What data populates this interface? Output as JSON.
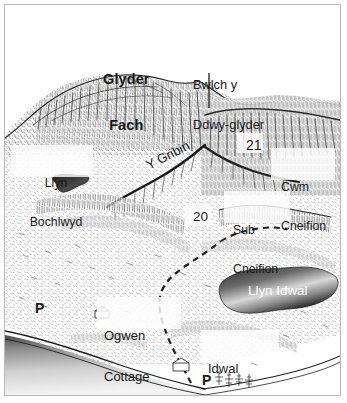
{
  "map": {
    "title": "Cwm Idwal and Glyderau panorama sketch map",
    "style": "pen-and-ink hachure panorama",
    "colors": {
      "ink": "#1a1a1a",
      "frame": "#b8b8b8",
      "paper": "#ffffff",
      "water_dark": "#2b2b2b",
      "water_light": "#f2f2f2",
      "label_on_water": "#ffffff"
    },
    "labels": [
      {
        "id": "glyder-fach",
        "text": "Glyder\nFach",
        "style": "bold",
        "kind": "summit"
      },
      {
        "id": "bwlch-y-ddwy-glyder",
        "text": "Bwlch y\nDdwy-glyder",
        "style": "regular",
        "kind": "pass",
        "leader": true
      },
      {
        "id": "llyn-bochlwyd",
        "text": "Llyn\nBochlwyd",
        "style": "regular",
        "kind": "lake"
      },
      {
        "id": "y-gribin",
        "text": "Y Gribin",
        "style": "regular",
        "kind": "ridge",
        "rotated": true
      },
      {
        "id": "cwm-cneifion",
        "text": "Cwm\nCneifion",
        "style": "regular",
        "kind": "cwm"
      },
      {
        "id": "sub-cneifion",
        "text": "Sub\nCneifion",
        "style": "regular",
        "kind": "crag"
      },
      {
        "id": "llyn-idwal",
        "text": "Llyn Idwal",
        "style": "regular",
        "kind": "lake"
      },
      {
        "id": "ogwen-cottage",
        "text": "Ogwen\nCottage",
        "style": "regular",
        "kind": "building"
      },
      {
        "id": "idwal-cottage",
        "text": "Idwal\nCottage",
        "style": "regular",
        "kind": "building"
      }
    ],
    "route_numbers": [
      {
        "id": "route-21",
        "text": "21"
      },
      {
        "id": "route-20",
        "text": "20"
      }
    ],
    "markers": [
      {
        "id": "parking-west",
        "text": "P",
        "kind": "parking"
      },
      {
        "id": "parking-east",
        "text": "P",
        "kind": "parking"
      }
    ],
    "features": {
      "glyder_fach_label": "Glyder",
      "glyder_fach_label_2": "Fach",
      "bwlch_label": "Bwlch y",
      "bwlch_label_2": "Ddwy-glyder",
      "llyn_bochlwyd_1": "Llyn",
      "llyn_bochlwyd_2": "Bochlwyd",
      "y_gribin": "Y Gribin",
      "route_21": "21",
      "cwm_cneifion_1": "Cwm",
      "cwm_cneifion_2": "Cneifion",
      "route_20": "20",
      "sub_cneifion_1": "Sub",
      "sub_cneifion_2": "Cneifion",
      "llyn_idwal": "Llyn Idwal",
      "ogwen_cottage_1": "Ogwen",
      "ogwen_cottage_2": "Cottage",
      "idwal_cottage_1": "Idwal",
      "idwal_cottage_2": "Cottage",
      "parking_west": "P",
      "parking_east": "P"
    }
  }
}
